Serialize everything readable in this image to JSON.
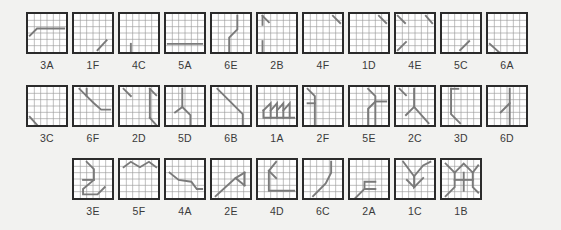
{
  "sheet": {
    "background_color": "#f2f2f0",
    "tile_border_color": "#2b2b2b",
    "grid_line_color": "#9a9a9a",
    "stroke_color": "#7a7a7a",
    "grid_divisions": 6,
    "rows": [
      {
        "row_index": 1,
        "tiles": [
          {
            "label": "3A",
            "paths": [
              "M2 24 L10 16 L40 16"
            ]
          },
          {
            "label": "1F",
            "paths": [
              "M26 40 L36 29"
            ]
          },
          {
            "label": "4C",
            "paths": [
              "M12 42 L12 33"
            ]
          },
          {
            "label": "5A",
            "paths": [
              "M2 33 L40 33"
            ]
          },
          {
            "label": "6E",
            "paths": [
              "M19 42 L19 26 L28 17 L28 2"
            ]
          },
          {
            "label": "2B",
            "paths": [
              "M5 2 L12 9",
              "M5 2 L5 12",
              "M5 30 L5 42"
            ]
          },
          {
            "label": "4F",
            "paths": [
              "M32 2 L40 10"
            ]
          },
          {
            "label": "1D",
            "paths": [
              "M32 2 L40 10"
            ]
          },
          {
            "label": "4E",
            "paths": [
              "M2 2 L10 10",
              "M33 2 L40 10",
              "M2 40 L11 31"
            ]
          },
          {
            "label": "5C",
            "paths": [
              "M20 40 L30 30"
            ]
          },
          {
            "label": "6A",
            "paths": [
              "M2 33 L12 42"
            ]
          }
        ]
      },
      {
        "row_index": 2,
        "tiles": [
          {
            "label": "3C",
            "paths": [
              "M2 33 L10 42"
            ]
          },
          {
            "label": "6F",
            "paths": [
              "M6 2 L14 10 L22 18 L30 25 L40 25",
              "M14 10 L14 2"
            ]
          },
          {
            "label": "2D",
            "paths": [
              "M4 2 L12 10",
              "M33 2 L40 9",
              "M33 2 L33 34",
              "M33 34 L40 42"
            ]
          },
          {
            "label": "5D",
            "paths": [
              "M18 2 L18 22 L10 28",
              "M18 22 L27 31 L27 42"
            ]
          },
          {
            "label": "6B",
            "paths": [
              "M6 2 L34 30 L34 42"
            ]
          },
          {
            "label": "1A",
            "paths": [
              "M6 26 L14 18 L14 34",
              "M14 26 L21 18 L21 34",
              "M21 26 L28 18 L28 34",
              "M28 26 L35 18 L35 34",
              "M6 26 L6 34 L40 34"
            ]
          },
          {
            "label": "2F",
            "paths": [
              "M4 2 L12 10 L12 42",
              "M12 18 L4 18"
            ]
          },
          {
            "label": "5E",
            "paths": [
              "M20 2 L28 10 L28 42",
              "M28 16 L20 24 L20 42",
              "M28 16 L40 16"
            ]
          },
          {
            "label": "2C",
            "paths": [
              "M4 2 L11 9",
              "M20 2 L20 22 L11 31",
              "M20 22 L36 40"
            ]
          },
          {
            "label": "3D",
            "paths": [
              "M10 2 L10 30 L20 40",
              "M10 2 L18 2"
            ]
          },
          {
            "label": "6D",
            "paths": [
              "M24 2 L24 18 L14 28",
              "M24 18 L24 42"
            ]
          }
        ]
      },
      {
        "row_index": 3,
        "tiles": [
          {
            "label": "3E",
            "paths": [
              "M14 2 L22 10 L22 22 L10 32 L10 38 L26 38 L34 30",
              "M22 22 L10 22"
            ]
          },
          {
            "label": "5F",
            "paths": [
              "M4 8 L12 2 L22 8 L32 2 L40 8"
            ]
          },
          {
            "label": "4A",
            "paths": [
              "M4 14 L14 22 L28 24 L34 32 L40 32"
            ]
          },
          {
            "label": "2E",
            "paths": [
              "M4 40 L26 20 L36 14",
              "M26 20 L36 28",
              "M36 14 L36 28"
            ]
          },
          {
            "label": "4D",
            "paths": [
              "M20 2 L12 12 L12 34 L40 34",
              "M12 12 L20 20"
            ]
          },
          {
            "label": "6C",
            "paths": [
              "M10 40 L24 26 L30 14 L30 2"
            ]
          },
          {
            "label": "2A",
            "paths": [
              "M6 42 L16 32 L28 32",
              "M16 32 L16 24 L28 24"
            ]
          },
          {
            "label": "1C",
            "paths": [
              "M8 2 L20 18 L30 6 L38 2",
              "M20 18 L20 30 L30 20",
              "M20 30 L12 22"
            ]
          },
          {
            "label": "1B",
            "paths": [
              "M4 4 L14 14 L24 4 L34 14 L40 6",
              "M14 14 L14 30 L4 40",
              "M24 14 L24 34",
              "M34 14 L34 30 L40 36",
              "M14 22 L24 22",
              "M24 22 L34 22"
            ]
          }
        ]
      }
    ]
  }
}
